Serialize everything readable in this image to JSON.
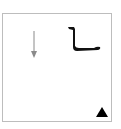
{
  "canvas": {
    "border_color": "#bdbdbd",
    "background": "#ffffff"
  },
  "elements": {
    "down_arrow": {
      "icon": "arrow-down-icon",
      "color": "#8a8a8a"
    },
    "l_stroke": {
      "icon": "l-shape-stroke-icon",
      "color": "#111111"
    },
    "triangle": {
      "icon": "triangle-up-icon",
      "color": "#000000"
    }
  }
}
